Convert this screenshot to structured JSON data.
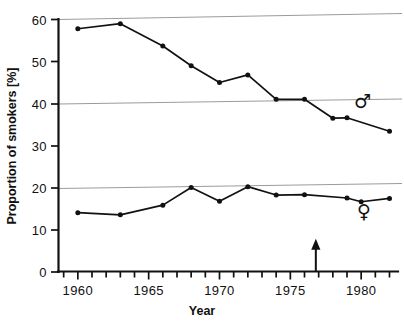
{
  "chart_data": {
    "type": "line",
    "title": "",
    "xlabel": "Year",
    "ylabel": "Proportion of smokers [%]",
    "xlim": [
      1958.6,
      1982.6
    ],
    "ylim": [
      0,
      60
    ],
    "grid": true,
    "gridlines_y": [
      20,
      40,
      60
    ],
    "legend_position": "inline-right",
    "x_ticks_major": [
      1960,
      1965,
      1970,
      1975,
      1980
    ],
    "x_tick_labels": [
      "1960",
      "1965",
      "1970",
      "1975",
      "1980"
    ],
    "x_ticks_minor_start": 1959,
    "x_ticks_minor_end": 1982,
    "y_ticks": [
      0,
      10,
      20,
      30,
      40,
      50,
      60
    ],
    "y_tick_labels": [
      "0",
      "10",
      "20",
      "30",
      "40",
      "50",
      "60"
    ],
    "series": [
      {
        "name": "male",
        "symbol": "♂",
        "label_x": 1980.1,
        "label_y": 39.0,
        "x": [
          1960,
          1963,
          1966,
          1968,
          1970,
          1972,
          1974,
          1976,
          1978,
          1979,
          1982
        ],
        "values": [
          57.8,
          59.0,
          53.7,
          49.0,
          45.0,
          46.8,
          41.0,
          41.0,
          36.5,
          36.6,
          33.4
        ]
      },
      {
        "name": "female",
        "symbol": "♀",
        "label_x": 1980.2,
        "label_y": 12.8,
        "x": [
          1960,
          1963,
          1966,
          1968,
          1970,
          1972,
          1974,
          1976,
          1979,
          1980,
          1982
        ],
        "values": [
          14.0,
          13.5,
          15.8,
          20.0,
          16.7,
          20.2,
          18.2,
          18.3,
          17.5,
          16.6,
          17.4
        ]
      }
    ],
    "annotations": [
      {
        "name": "event-arrow",
        "type": "up-arrow",
        "x": 1976.8,
        "y_base": 0,
        "y_top": 7.2
      }
    ]
  },
  "axis": {
    "y_title": "Proportion of smokers [%]",
    "x_title": "Year"
  }
}
